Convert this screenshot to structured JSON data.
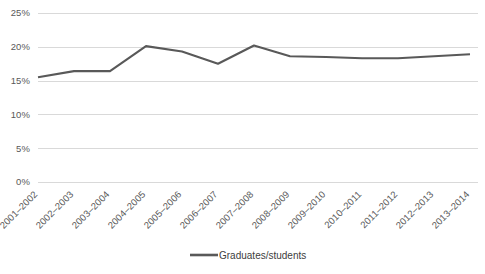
{
  "chart_data": {
    "type": "line",
    "title": "",
    "xlabel": "",
    "ylabel": "",
    "categories": [
      "2001–2002",
      "2002–2003",
      "2003–2004",
      "2004–2005",
      "2005–2006",
      "2006–2007",
      "2007–2008",
      "2008–2009",
      "2009–2010",
      "2010–2011",
      "2011–2012",
      "2012–2013",
      "2013–2014"
    ],
    "series": [
      {
        "name": "Graduates/students",
        "values": [
          15.5,
          16.4,
          16.4,
          20.1,
          19.3,
          17.5,
          20.2,
          18.6,
          18.5,
          18.3,
          18.3,
          18.6,
          18.9
        ],
        "color": "#595959"
      }
    ],
    "ylim": [
      0,
      25
    ],
    "ytick_labels": [
      "0%",
      "5%",
      "10%",
      "15%",
      "20%",
      "25%"
    ],
    "ytick_values": [
      0,
      5,
      10,
      15,
      20,
      25
    ],
    "grid": true,
    "grid_color": "#d9d9d9",
    "legend": {
      "position": "bottom",
      "entries": [
        {
          "label": "Graduates/students",
          "color": "#595959"
        }
      ]
    },
    "xtick_rotation": -45,
    "background": "#ffffff",
    "text_color": "#595959"
  }
}
